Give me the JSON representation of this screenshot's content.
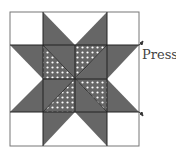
{
  "diagram": {
    "type": "quilt-block",
    "grid": 4,
    "colors": {
      "background": "#ffffff",
      "dark": "#666666",
      "dots": "#ffffff",
      "line": "#222222"
    },
    "annotation": {
      "label": "Press",
      "arrows": [
        "up",
        "down"
      ]
    }
  }
}
